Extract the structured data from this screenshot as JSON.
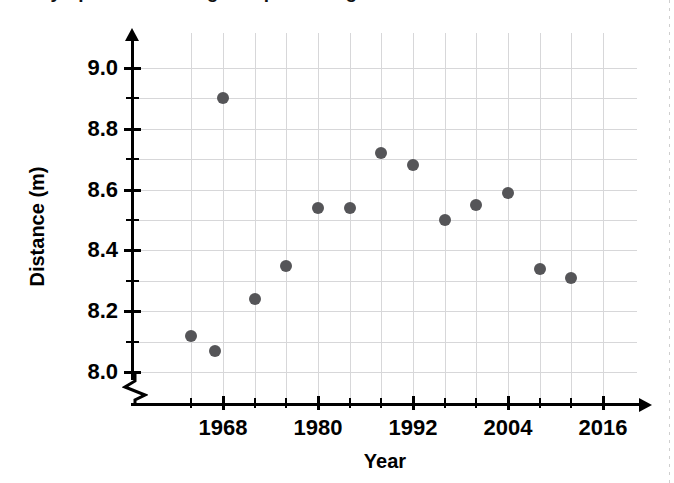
{
  "title": "Olympic Men's Long Jump Winning Distances",
  "axes": {
    "x_title": "Year",
    "y_title": "Distance (m)",
    "x_tick_labels": [
      "1968",
      "1980",
      "1992",
      "2004",
      "2016"
    ],
    "y_tick_labels": [
      "9.0",
      "8.8",
      "8.6",
      "8.4",
      "8.2",
      "8.0"
    ],
    "y_break_symbol": "axis-break"
  },
  "chart_data": {
    "type": "scatter",
    "title": "Olympic Men's Long Jump Winning Distances",
    "xlabel": "Year",
    "ylabel": "Distance (m)",
    "xlim": [
      1960,
      2018
    ],
    "ylim": [
      7.95,
      9.05
    ],
    "x_ticks_major": [
      1968,
      1980,
      1992,
      2004,
      2016
    ],
    "x_ticks_minor": [
      1964,
      1972,
      1976,
      1984,
      1988,
      1996,
      2000,
      2008,
      2012
    ],
    "y_ticks_major": [
      8.0,
      8.2,
      8.4,
      8.6,
      8.8,
      9.0
    ],
    "y_ticks_minor": [
      8.1,
      8.3,
      8.5,
      8.7,
      8.9
    ],
    "grid": true,
    "legend": false,
    "x": [
      1964,
      1968,
      1972,
      1976,
      1980,
      1984,
      1988,
      1992,
      1996,
      2000,
      2004,
      2008,
      2012
    ],
    "y": [
      8.12,
      8.9,
      8.24,
      8.35,
      8.54,
      8.54,
      8.72,
      8.68,
      8.5,
      8.55,
      8.59,
      8.34,
      8.31
    ],
    "points": [
      {
        "year": 1964,
        "distance": 8.12
      },
      {
        "year": 1967,
        "distance": 8.07
      },
      {
        "year": 1968,
        "distance": 8.9
      },
      {
        "year": 1972,
        "distance": 8.24
      },
      {
        "year": 1976,
        "distance": 8.35
      },
      {
        "year": 1980,
        "distance": 8.54
      },
      {
        "year": 1984,
        "distance": 8.54
      },
      {
        "year": 1988,
        "distance": 8.72
      },
      {
        "year": 1992,
        "distance": 8.68
      },
      {
        "year": 1996,
        "distance": 8.5
      },
      {
        "year": 2000,
        "distance": 8.55
      },
      {
        "year": 2004,
        "distance": 8.59
      },
      {
        "year": 2008,
        "distance": 8.34
      },
      {
        "year": 2012,
        "distance": 8.31
      }
    ],
    "marker_color": "#555558",
    "grid_color": "#d7d7d9",
    "axis_color": "#000000"
  }
}
